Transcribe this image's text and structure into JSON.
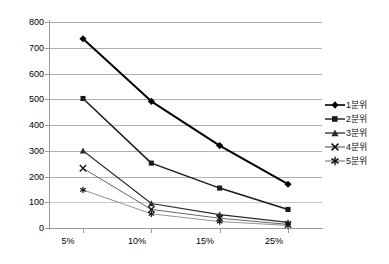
{
  "chart_data": {
    "type": "line",
    "title": "",
    "xlabel": "",
    "ylabel": "",
    "categories": [
      "5%",
      "10%",
      "15%",
      "25%"
    ],
    "ylim": [
      0,
      800
    ],
    "ytick_step": 100,
    "yticks": [
      "0",
      "100",
      "200",
      "300",
      "400",
      "500",
      "600",
      "700",
      "800"
    ],
    "grid": true,
    "legend_position": "right",
    "series": [
      {
        "name": "1분위",
        "marker": "diamond",
        "color": "#000000",
        "values": [
          735,
          492,
          320,
          170
        ]
      },
      {
        "name": "2분위",
        "marker": "square",
        "color": "#1a1a1a",
        "values": [
          503,
          252,
          155,
          72
        ]
      },
      {
        "name": "3분위",
        "marker": "triangle",
        "color": "#2b2b2b",
        "values": [
          300,
          95,
          52,
          22
        ]
      },
      {
        "name": "4분위",
        "marker": "x",
        "color": "#555555",
        "values": [
          232,
          72,
          38,
          14
        ]
      },
      {
        "name": "5분위",
        "marker": "star",
        "color": "#777777",
        "values": [
          148,
          55,
          25,
          10
        ]
      }
    ]
  },
  "legend": {
    "items": [
      {
        "label": "1분위"
      },
      {
        "label": "2분위"
      },
      {
        "label": "3분위"
      },
      {
        "label": "4분위"
      },
      {
        "label": "5분위"
      }
    ]
  }
}
